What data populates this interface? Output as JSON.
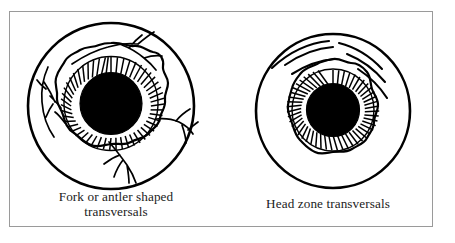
{
  "figure": {
    "border_color": "#9a9a9a",
    "background_color": "#ffffff",
    "ink_color": "#000000"
  },
  "panels": [
    {
      "id": "fork-or-antler-shaped-transversals",
      "caption_lines": [
        "Fork or antler shaped",
        "transversals"
      ],
      "diagram": {
        "name": "iris-diagram-fork-antler",
        "parts": [
          "sclera-outer-circle",
          "collarette-wavy-ring",
          "iris-radial-fibers",
          "pupil-black-disc",
          "transversal-vessel-top",
          "transversal-vessel-left",
          "transversal-vessel-right",
          "transversal-vessel-bottom"
        ]
      }
    },
    {
      "id": "head-zone-transversals",
      "caption_lines": [
        "Head zone transversals"
      ],
      "diagram": {
        "name": "iris-diagram-head-zone",
        "parts": [
          "sclera-outer-circle",
          "collarette-wavy-ring",
          "iris-radial-fibers",
          "pupil-black-disc",
          "head-zone-arc-1",
          "head-zone-arc-2",
          "head-zone-arc-3",
          "head-zone-arc-4",
          "head-zone-arc-5"
        ]
      }
    }
  ]
}
